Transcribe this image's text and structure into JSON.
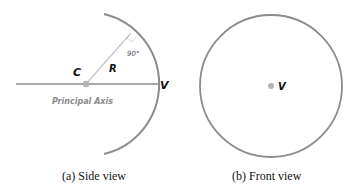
{
  "side_view": {
    "caption": "(a) Side view",
    "center_label": "C",
    "radius_label": "R",
    "vertex_label": "V",
    "angle_label": "90°",
    "axis_label": "Principal Axis"
  },
  "front_view": {
    "caption": "(b) Front view",
    "vertex_label": "V"
  },
  "colors": {
    "mirror": "#8c8c8c",
    "axis": "#555555",
    "radius_line": "#bdbdbd",
    "point": "#b0b0b0"
  }
}
